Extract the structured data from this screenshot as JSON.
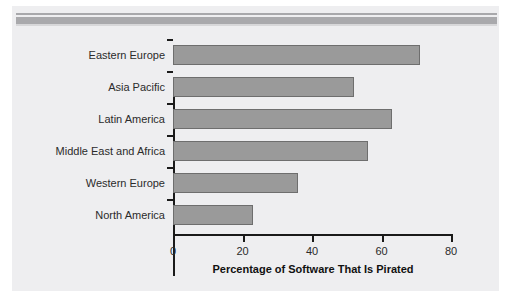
{
  "chart_data": {
    "type": "bar",
    "orientation": "horizontal",
    "title": "",
    "subtitle": "",
    "xlabel": "Percentage of Software That Is Pirated",
    "ylabel": "",
    "categories": [
      "Eastern Europe",
      "Asia Pacific",
      "Latin America",
      "Middle East and Africa",
      "Western Europe",
      "North America"
    ],
    "values": [
      71,
      52,
      63,
      56,
      36,
      23
    ],
    "xlim": [
      0,
      80
    ],
    "xticks": [
      0,
      20,
      40,
      60,
      80
    ],
    "xtick_labels": [
      "0",
      "20",
      "40",
      "60",
      "80"
    ],
    "grid": false,
    "legend": null,
    "bar_color": "#9a9a9a",
    "bar_border_color": "#6e6e6e",
    "axis_color": "#1a1a1a",
    "background_color": "#eeeef0"
  }
}
